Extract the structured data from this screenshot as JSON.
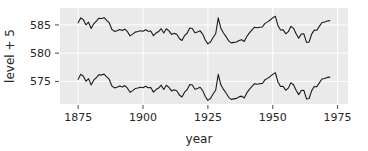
{
  "chart_data": {
    "type": "line",
    "title": "",
    "xlabel": "year",
    "ylabel": "level + 5",
    "xlim": [
      1868,
      1979
    ],
    "ylim": [
      571.0,
      588.0
    ],
    "grid": true,
    "legend": false,
    "xticks": [
      1875,
      1900,
      1925,
      1950,
      1975
    ],
    "xtick_labels": [
      "1875",
      "1900",
      "1925",
      "1950",
      "1975"
    ],
    "yticks": [
      575,
      580,
      585
    ],
    "ytick_labels": [
      "575",
      "580",
      "585"
    ],
    "line_color": "#1a1a1a",
    "background_color": "#eaeaea",
    "gridline_color": "#ffffff",
    "x": [
      1875,
      1876,
      1877,
      1878,
      1879,
      1880,
      1881,
      1882,
      1883,
      1884,
      1885,
      1886,
      1887,
      1888,
      1889,
      1890,
      1891,
      1892,
      1893,
      1894,
      1895,
      1896,
      1897,
      1898,
      1899,
      1900,
      1901,
      1902,
      1903,
      1904,
      1905,
      1906,
      1907,
      1908,
      1909,
      1910,
      1911,
      1912,
      1913,
      1914,
      1915,
      1916,
      1917,
      1918,
      1919,
      1920,
      1921,
      1922,
      1923,
      1924,
      1925,
      1926,
      1927,
      1928,
      1929,
      1930,
      1931,
      1932,
      1933,
      1934,
      1935,
      1936,
      1937,
      1938,
      1939,
      1940,
      1941,
      1942,
      1943,
      1944,
      1945,
      1946,
      1947,
      1948,
      1949,
      1950,
      1951,
      1952,
      1953,
      1954,
      1955,
      1956,
      1957,
      1958,
      1959,
      1960,
      1961,
      1962,
      1963,
      1964,
      1965,
      1966,
      1967,
      1968,
      1969,
      1970,
      1971,
      1972
    ],
    "series": [
      {
        "name": "level + 5",
        "offset": 5,
        "values": [
          585.38,
          586.25,
          585.91,
          585.02,
          585.49,
          584.38,
          585.21,
          585.69,
          586.19,
          586.15,
          586.29,
          585.82,
          585.35,
          584.18,
          583.86,
          583.98,
          584.19,
          584.01,
          584.27,
          583.8,
          583.07,
          583.37,
          583.73,
          583.84,
          583.96,
          583.89,
          584.14,
          583.87,
          583.93,
          583.1,
          583.56,
          583.83,
          584.33,
          583.58,
          584.32,
          583.95,
          583.32,
          583.51,
          583.35,
          582.6,
          582.24,
          583.1,
          583.53,
          584.45,
          584.36,
          583.61,
          583.76,
          583.96,
          583.37,
          582.33,
          581.65,
          581.97,
          582.78,
          583.44,
          586.26,
          584.4,
          583.58,
          582.94,
          582.18,
          581.82,
          581.91,
          581.99,
          582.26,
          582.39,
          582.06,
          582.96,
          583.59,
          584.14,
          584.6,
          584.49,
          584.6,
          584.63,
          585.28,
          585.54,
          585.88,
          586.25,
          586.53,
          584.91,
          584.1,
          584.12,
          583.43,
          583.81,
          584.75,
          584.4,
          583.45,
          582.66,
          583.4,
          583.41,
          581.9,
          581.98,
          583.37,
          584.09,
          584.06,
          584.79,
          585.43,
          585.52,
          585.71,
          585.76
        ]
      },
      {
        "name": "level - 5",
        "offset": -5,
        "values": [
          575.38,
          576.25,
          575.91,
          575.02,
          575.49,
          574.38,
          575.21,
          575.69,
          576.19,
          576.15,
          576.29,
          575.82,
          575.35,
          574.18,
          573.86,
          573.98,
          574.19,
          574.01,
          574.27,
          573.8,
          573.07,
          573.37,
          573.73,
          573.84,
          573.96,
          573.89,
          574.14,
          573.87,
          573.93,
          573.1,
          573.56,
          573.83,
          574.33,
          573.58,
          574.32,
          573.95,
          573.32,
          573.51,
          573.35,
          572.6,
          572.24,
          573.1,
          573.53,
          574.45,
          574.36,
          573.61,
          573.76,
          573.96,
          573.37,
          572.33,
          571.65,
          571.97,
          572.78,
          573.44,
          576.26,
          574.4,
          573.58,
          572.94,
          572.18,
          571.82,
          571.91,
          571.99,
          572.26,
          572.39,
          572.06,
          572.96,
          573.59,
          574.14,
          574.6,
          574.49,
          574.6,
          574.63,
          575.28,
          575.54,
          575.88,
          576.25,
          576.53,
          574.91,
          574.1,
          574.12,
          573.43,
          573.81,
          574.75,
          574.4,
          573.45,
          572.66,
          573.4,
          573.41,
          571.9,
          571.98,
          573.37,
          574.09,
          574.06,
          574.79,
          575.43,
          575.52,
          575.71,
          575.76
        ]
      }
    ]
  }
}
